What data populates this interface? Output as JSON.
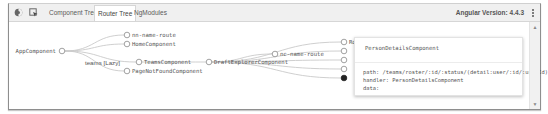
{
  "toolbar": {
    "icons": [
      {
        "name": "select-element-icon",
        "glyph": "◐"
      },
      {
        "name": "inspect-icon",
        "glyph": "⬚"
      }
    ],
    "tabs": [
      {
        "label": "Component Tree",
        "active": false
      },
      {
        "label": "Router Tree",
        "active": true
      },
      {
        "label": "NgModules",
        "active": false
      }
    ],
    "version_label": "Angular Version: 4.4.3",
    "menu_icon": "kebab-menu-icon"
  },
  "router_tree": {
    "nodes": [
      {
        "id": "app",
        "label": "AppComponent",
        "x": 53,
        "y": 29,
        "label_side": "left",
        "filled": false
      },
      {
        "id": "teams-lazy",
        "label": "teams [Lazy]",
        "x": 117,
        "y": 40,
        "label_side": "left",
        "filled": false,
        "plain_text": true,
        "no_circle": true
      },
      {
        "id": "nn1",
        "label": "nn-name-route",
        "x": 118,
        "y": 13,
        "label_side": "right",
        "filled": false
      },
      {
        "id": "home",
        "label": "HomeComponent",
        "x": 118,
        "y": 22,
        "label_side": "right",
        "filled": false
      },
      {
        "id": "teams",
        "label": "TeamsComponent",
        "x": 130,
        "y": 40,
        "label_side": "right",
        "filled": false
      },
      {
        "id": "pnf",
        "label": "PageNotFoundComponent",
        "x": 118,
        "y": 49,
        "label_side": "right",
        "filled": false
      },
      {
        "id": "draft",
        "label": "DraftExplorerComponent",
        "x": 200,
        "y": 40,
        "label_side": "right",
        "filled": false
      },
      {
        "id": "nn2",
        "label": "nc-name-route",
        "x": 266,
        "y": 32,
        "label_side": "right",
        "filled": false
      },
      {
        "id": "c1",
        "label": "RosterComponent",
        "x": 335,
        "y": 20,
        "label_side": "right",
        "filled": false
      },
      {
        "id": "c2",
        "label": "",
        "x": 335,
        "y": 29,
        "label_side": "right",
        "filled": false
      },
      {
        "id": "c3",
        "label": "",
        "x": 335,
        "y": 38,
        "label_side": "right",
        "filled": false
      },
      {
        "id": "c4",
        "label": "",
        "x": 335,
        "y": 47,
        "label_side": "right",
        "filled": false
      },
      {
        "id": "c5",
        "label": "",
        "x": 335,
        "y": 56,
        "label_side": "right",
        "filled": true
      }
    ],
    "edges": [
      [
        "app",
        "nn1"
      ],
      [
        "app",
        "home"
      ],
      [
        "app",
        "teams"
      ],
      [
        "app",
        "pnf"
      ],
      [
        "teams",
        "draft"
      ],
      [
        "draft",
        "nn2"
      ],
      [
        "draft",
        "c1"
      ],
      [
        "draft",
        "c2"
      ],
      [
        "draft",
        "c3"
      ],
      [
        "draft",
        "c4"
      ],
      [
        "draft",
        "c5"
      ]
    ]
  },
  "tooltip": {
    "title": "PersonDetailsComponent",
    "path_line": "path: /teams/roster/:id/:status/(detail:user/:id/:userId)",
    "handler_line": "handler: PersonDetailsComponent",
    "data_line": "data:"
  },
  "colors": {
    "edge": "#c9c9c9",
    "node_stroke": "#8a8a8a",
    "node_fill": "#ffffff",
    "node_selected": "#222222"
  }
}
